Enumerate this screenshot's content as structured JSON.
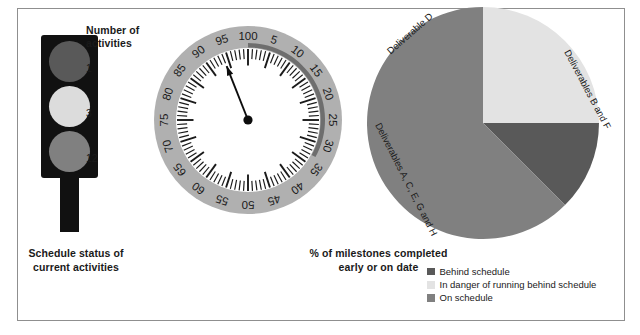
{
  "figure": {
    "background": "#ffffff",
    "border_color": "#8f8f8f"
  },
  "traffic_light": {
    "caption": "Schedule status of current activities",
    "caption_line1": "Schedule status of",
    "caption_line2": "current activities",
    "count_heading_line1": "Number of",
    "count_heading_line2": "activities",
    "lamps": [
      {
        "status": "Behind schedule",
        "count": "1",
        "color": "#595959"
      },
      {
        "status": "In danger of running behind schedule",
        "count": "3",
        "color": "#dcdcdc"
      },
      {
        "status": "On schedule",
        "count": "12",
        "color": "#808080"
      }
    ],
    "housing_color": "#111111"
  },
  "gauge": {
    "caption_line1": "% of milestones completed",
    "caption_line2": "early or on date",
    "caption": "% of milestones completed early or on date",
    "needle_value": 94,
    "ring_color": "#b0b0b0",
    "highlight_arc_color": "#6e6e6e",
    "highlight_arc_start": 0,
    "highlight_arc_end": 33,
    "face_color": "#ffffff",
    "tick_color": "#1a1a1a",
    "needle_color": "#0d0d0d",
    "tick_count": 100,
    "major_every": 5,
    "labels": [
      "5",
      "10",
      "15",
      "20",
      "25",
      "30",
      "35",
      "40",
      "45",
      "50",
      "55",
      "60",
      "65",
      "70",
      "75",
      "80",
      "85",
      "90",
      "95",
      "100"
    ],
    "label_values": [
      5,
      10,
      15,
      20,
      25,
      30,
      35,
      40,
      45,
      50,
      55,
      60,
      65,
      70,
      75,
      80,
      85,
      90,
      95,
      100
    ]
  },
  "pie": {
    "labels": [
      {
        "text": "Deliverable D",
        "angle": -41
      },
      {
        "text": "Deliverables B and F",
        "angle": 62
      },
      {
        "text": "Deliverables A, C, E, G and H",
        "angle": 63
      }
    ],
    "label_d": "Deliverable D",
    "label_bf": "Deliverables B and F",
    "label_aceg": "Deliverables A, C, E, G and H"
  },
  "legend": {
    "items": [
      {
        "label": "Behind schedule",
        "color": "#595959"
      },
      {
        "label": "In danger of running behind schedule",
        "color": "#e3e3e3"
      },
      {
        "label": "On schedule",
        "color": "#808080"
      }
    ]
  },
  "chart_data": [
    {
      "type": "table",
      "title": "Schedule status of current activities",
      "categories": [
        "Behind schedule",
        "In danger of running behind schedule",
        "On schedule"
      ],
      "values": [
        1,
        3,
        12
      ],
      "xlabel": "Schedule status",
      "ylabel": "Number of activities"
    },
    {
      "type": "gauge",
      "title": "% of milestones completed early or on date",
      "value": 94,
      "ylim": [
        0,
        100
      ],
      "tick_labels": [
        5,
        10,
        15,
        20,
        25,
        30,
        35,
        40,
        45,
        50,
        55,
        60,
        65,
        70,
        75,
        80,
        85,
        90,
        95,
        100
      ],
      "xlabel": "",
      "ylabel": "% of milestones completed early or on date"
    },
    {
      "type": "pie",
      "title": "Deliverables by schedule status",
      "categories": [
        "Deliverables B and F",
        "Deliverable D",
        "Deliverables A, C, E, G and H"
      ],
      "values": [
        25,
        12.5,
        62.5
      ],
      "colors": [
        "#e3e3e3",
        "#595959",
        "#808080"
      ],
      "legend": [
        "Behind schedule",
        "In danger of running behind schedule",
        "On schedule"
      ],
      "legend_position": "bottom-right"
    }
  ]
}
